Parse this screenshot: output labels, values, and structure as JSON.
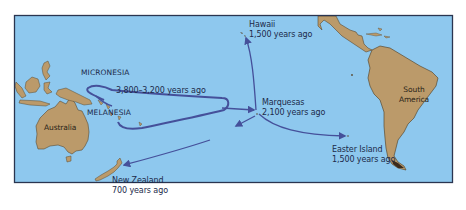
{
  "map": {
    "colors": {
      "ocean": "#8ec8ee",
      "land": "#bb9a6a",
      "land_outline": "#5a4a30",
      "route": "#45509a",
      "text": "#1c2a4a",
      "frame": "#2a3550"
    },
    "regions": [
      {
        "name": "MICRONESIA"
      },
      {
        "name": "MELANESIA"
      }
    ],
    "landmasses": [
      {
        "name": "Australia"
      },
      {
        "name": "South America",
        "line1": "South",
        "line2": "America"
      }
    ],
    "migration_labels": {
      "core": {
        "text": "3,800–3,200 years ago"
      },
      "hawaii": {
        "place": "Hawaii",
        "time": "1,500 years ago"
      },
      "marquesas": {
        "place": "Marquesas",
        "time": "2,100 years ago"
      },
      "easter_island": {
        "place": "Easter Island",
        "time": "1,500 years ago"
      },
      "new_zealand": {
        "place": "New Zealand",
        "time": "700 years ago"
      }
    }
  }
}
